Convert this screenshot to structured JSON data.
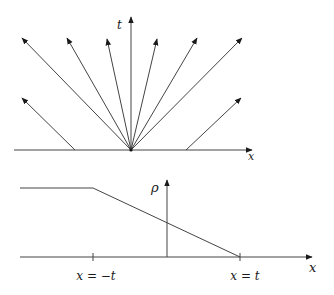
{
  "top_panel": {
    "vertical_axis_label": "t",
    "horizontal_axis_label": "x",
    "description": "Fan of characteristic lines emanating from origin plus parallel characteristics"
  },
  "bottom_panel": {
    "vertical_axis_label": "ρ",
    "horizontal_axis_label": "x",
    "tick_labels": [
      "x = −t",
      "x = t"
    ]
  },
  "colors": {
    "line": "#333333",
    "background": "#ffffff"
  }
}
